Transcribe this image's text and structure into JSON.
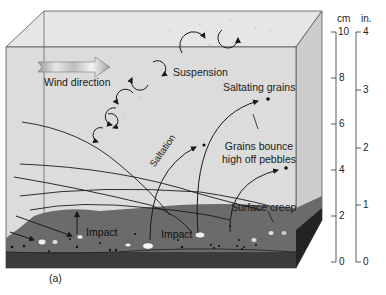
{
  "diagram": {
    "panel_label": "(a)",
    "labels": {
      "wind_direction": "Wind direction",
      "suspension": "Suspension",
      "saltating_grains": "Saltating grains",
      "grains_bounce_line1": "Grains bounce",
      "grains_bounce_line2": "high off pebbles",
      "saltation": "Saltation",
      "surface_creep": "Surface creep",
      "impact_left": "Impact",
      "impact_right": "Impact"
    },
    "scales": {
      "cm": {
        "unit": "cm",
        "ticks": [
          "10",
          "8",
          "6",
          "4",
          "2",
          "0"
        ]
      },
      "in": {
        "unit": "in.",
        "ticks": [
          "4",
          "3",
          "2",
          "1",
          "0"
        ]
      }
    },
    "colors": {
      "box_front": "#dedede",
      "box_top": "#e8e8e8",
      "box_side": "#cfcfcf",
      "ground_top": "#6a6a6a",
      "ground_front": "#3a3a3a",
      "ground_side": "#222222",
      "line": "#1a1a1a"
    }
  }
}
